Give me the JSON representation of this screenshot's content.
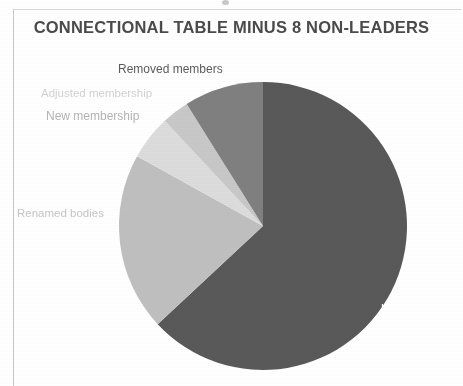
{
  "document": {
    "title": "CONNECTIONAL TABLE MINUS 8 NON-LEADERS"
  },
  "labels": {
    "removed_members": "Removed members",
    "adjusted_membership": "Adjusted membership",
    "new_membership": "New membership",
    "renamed_bodies": "Renamed bodies",
    "unchanged": "Unchanged"
  },
  "colors": {
    "unchanged": "#595959",
    "renamed_bodies": "#bfbfbf",
    "new_membership": "#dcdcdc",
    "adjusted_membership": "#c8c8c8",
    "removed_members": "#808080",
    "title_text": "#4b4b4b",
    "page_background": "#ffffff"
  },
  "chart_data": {
    "type": "pie",
    "title": "CONNECTIONAL TABLE MINUS 8 NON-LEADERS",
    "xlabel": "",
    "ylabel": "",
    "legend": "none",
    "labels_placement": "outside-left-and-inside-right",
    "start_angle_deg": 0,
    "direction": "clockwise",
    "categories": [
      "Unchanged",
      "Renamed bodies",
      "New membership",
      "Adjusted membership",
      "Removed members"
    ],
    "values": [
      63,
      20,
      5,
      3,
      9
    ],
    "units": "percent",
    "slices": [
      {
        "label": "Unchanged",
        "value": 63,
        "color": "#595959",
        "start_deg": 0,
        "end_deg": 227
      },
      {
        "label": "Renamed bodies",
        "value": 20,
        "color": "#bfbfbf",
        "start_deg": 227,
        "end_deg": 299
      },
      {
        "label": "New membership",
        "value": 5,
        "color": "#dcdcdc",
        "start_deg": 299,
        "end_deg": 317
      },
      {
        "label": "Adjusted membership",
        "value": 3,
        "color": "#c8c8c8",
        "start_deg": 317,
        "end_deg": 328
      },
      {
        "label": "Removed members",
        "value": 9,
        "color": "#808080",
        "start_deg": 328,
        "end_deg": 360
      }
    ]
  }
}
